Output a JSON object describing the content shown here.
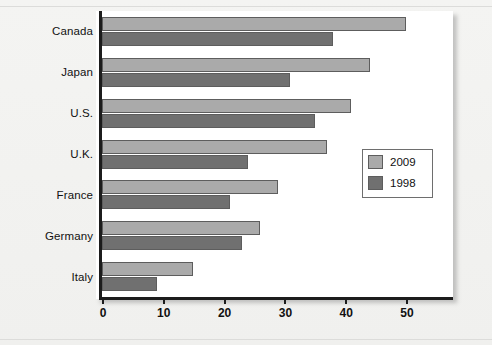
{
  "chart_data": {
    "type": "bar",
    "orientation": "horizontal",
    "title": "",
    "subtitle": "",
    "xlabel": "",
    "ylabel": "",
    "categories": [
      "Canada",
      "Japan",
      "U.S.",
      "U.K.",
      "France",
      "Germany",
      "Italy"
    ],
    "series": [
      {
        "name": "2009",
        "color": "#aaaaaa",
        "values": [
          50,
          44,
          41,
          37,
          29,
          26,
          15
        ]
      },
      {
        "name": "1998",
        "color": "#707070",
        "values": [
          38,
          31,
          35,
          24,
          21,
          23,
          9
        ]
      }
    ],
    "xlim": [
      0,
      55
    ],
    "xticks": [
      0,
      10,
      20,
      30,
      40,
      50
    ],
    "xtick_labels": [
      "0",
      "10",
      "20",
      "30",
      "40",
      "50"
    ],
    "grid": false,
    "legend_position": "center-right",
    "legend_entries": [
      "2009",
      "1998"
    ]
  },
  "axis": {
    "ticks": [
      {
        "label": "0",
        "value": 0
      },
      {
        "label": "10",
        "value": 10
      },
      {
        "label": "20",
        "value": 20
      },
      {
        "label": "30",
        "value": 30
      },
      {
        "label": "40",
        "value": 40
      },
      {
        "label": "50",
        "value": 50
      }
    ]
  },
  "legend": {
    "items": [
      {
        "label": "2009",
        "color": "#aaaaaa"
      },
      {
        "label": "1998",
        "color": "#707070"
      }
    ]
  },
  "colors": {
    "page_background": "#f2f2f0",
    "plot_background": "#ffffff",
    "axis": "#1c1c1c",
    "series_2009": "#aaaaaa",
    "series_1998": "#707070",
    "bar_outline": "#5d5d5d"
  }
}
